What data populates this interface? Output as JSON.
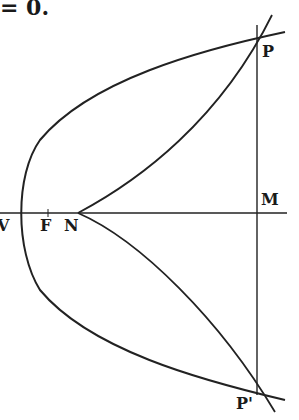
{
  "caption_fragment": "= 0.",
  "figure": {
    "type": "parabola with normals from point N",
    "points": {
      "V": {
        "label": "V",
        "x": 20,
        "y": 213
      },
      "F": {
        "label": "F",
        "x": 48,
        "y": 213
      },
      "N": {
        "label": "N",
        "x": 78,
        "y": 213
      },
      "M": {
        "label": "M",
        "x": 257,
        "y": 213
      },
      "P": {
        "label": "P",
        "x": 258,
        "y": 40
      },
      "P_prime": {
        "label": "P'",
        "x": 253,
        "y": 383
      }
    },
    "stroke_color": "#222222"
  }
}
